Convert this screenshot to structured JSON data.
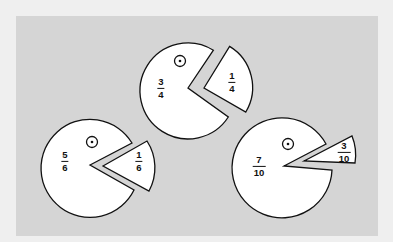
{
  "colors": {
    "frame": "#efefef",
    "panel": "#d5d5d5",
    "piece_fill": "#ffffff",
    "stroke": "#111111"
  },
  "pies": [
    {
      "id": "three-quarters",
      "main": {
        "numerator": "3",
        "denominator": "4"
      },
      "slice": {
        "numerator": "1",
        "denominator": "4"
      }
    },
    {
      "id": "five-sixths",
      "main": {
        "numerator": "5",
        "denominator": "6"
      },
      "slice": {
        "numerator": "1",
        "denominator": "6"
      }
    },
    {
      "id": "seven-tenths",
      "main": {
        "numerator": "7",
        "denominator": "10"
      },
      "slice": {
        "numerator": "3",
        "denominator": "10"
      }
    }
  ]
}
